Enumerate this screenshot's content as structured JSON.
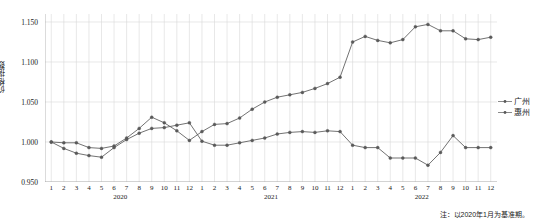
{
  "chart_data": {
    "type": "line",
    "title": "",
    "xlabel": "",
    "ylabel": "价格指数",
    "ylim": [
      0.95,
      1.16
    ],
    "yticks": [
      0.95,
      1.0,
      1.05,
      1.1,
      1.15
    ],
    "ytick_labels": [
      "0.950",
      "1.000",
      "1.050",
      "1.100",
      "1.150"
    ],
    "grid": true,
    "legend_position": "right",
    "categories": [
      "1",
      "2",
      "3",
      "4",
      "5",
      "6",
      "7",
      "8",
      "9",
      "10",
      "11",
      "12",
      "1",
      "2",
      "3",
      "4",
      "5",
      "6",
      "7",
      "8",
      "9",
      "10",
      "11",
      "12",
      "1",
      "2",
      "3",
      "4",
      "5",
      "6",
      "7",
      "8",
      "9",
      "10",
      "11",
      "12"
    ],
    "year_groups": [
      {
        "label": "2020",
        "start": 0,
        "end": 11
      },
      {
        "label": "2021",
        "start": 12,
        "end": 23
      },
      {
        "label": "2022",
        "start": 24,
        "end": 35
      }
    ],
    "series": [
      {
        "name": "广州",
        "color": "#595959",
        "values": [
          1.0,
          0.999,
          0.999,
          0.993,
          0.992,
          0.995,
          1.005,
          1.017,
          1.031,
          1.024,
          1.014,
          1.002,
          1.013,
          1.022,
          1.023,
          1.03,
          1.041,
          1.05,
          1.056,
          1.059,
          1.062,
          1.067,
          1.073,
          1.081,
          1.125,
          1.132,
          1.127,
          1.124,
          1.128,
          1.144,
          1.147,
          1.139,
          1.139,
          1.129,
          1.128,
          1.131
        ]
      },
      {
        "name": "惠州",
        "color": "#595959",
        "values": [
          1.0,
          0.992,
          0.986,
          0.983,
          0.981,
          0.993,
          1.003,
          1.011,
          1.017,
          1.018,
          1.021,
          1.024,
          1.001,
          0.996,
          0.996,
          0.999,
          1.002,
          1.005,
          1.01,
          1.012,
          1.013,
          1.012,
          1.014,
          1.013,
          0.996,
          0.993,
          0.993,
          0.98,
          0.98,
          0.98,
          0.971,
          0.987,
          1.008,
          0.993,
          0.993,
          0.993
        ]
      }
    ],
    "note": "注：以2020年1月为基准期。"
  },
  "legend": {
    "items": [
      {
        "label": "广州"
      },
      {
        "label": "惠州"
      }
    ]
  }
}
